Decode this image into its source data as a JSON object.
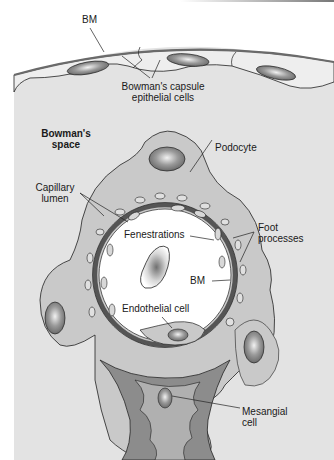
{
  "diagram": {
    "colors": {
      "background": "#ffffff",
      "bowman_space": "#e3e3e3",
      "podocyte": "#c9c9c9",
      "capillary_lumen": "#ffffff",
      "basement_membrane": "#6a6a6a",
      "mesangium": "#8c8c8c",
      "nucleus": "#7a7a7a",
      "outline": "#222222"
    },
    "labels": {
      "bm_top": "BM",
      "bowman_capsule_cells_line1": "Bowman's capsule",
      "bowman_capsule_cells_line2": "epithelial cells",
      "bowman_space_line1": "Bowman's",
      "bowman_space_line2": "space",
      "podocyte": "Podocyte",
      "capillary_lumen_line1": "Capillary",
      "capillary_lumen_line2": "lumen",
      "fenestrations": "Fenestrations",
      "foot_processes_line1": "Foot",
      "foot_processes_line2": "processes",
      "bm_inner": "BM",
      "endothelial_cell": "Endothelial cell",
      "mesangial_cell_line1": "Mesangial",
      "mesangial_cell_line2": "cell"
    }
  }
}
